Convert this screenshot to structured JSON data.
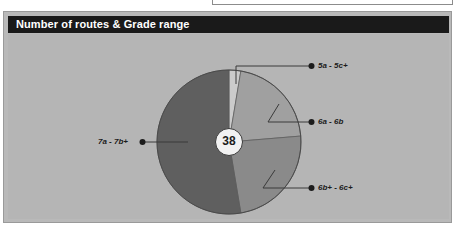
{
  "card": {
    "title": "Number of routes & Grade range",
    "center_total": "38"
  },
  "colors": {
    "title_bar_bg": "#1a1a1a",
    "title_text": "#ffffff",
    "panel_bg": "#b5b5b5",
    "card_border": "#9a9a9a",
    "slice_5a_5c": "#cbcbcb",
    "slice_6a_6b": "#a0a0a0",
    "slice_6bp_6cp": "#8a8a8a",
    "slice_7a_7bp": "#5f5f5f",
    "leader_line": "#3a3a3a",
    "bullet": "#1c1c1c",
    "center_circle_fill": "#f2f2f2"
  },
  "labels": {
    "grade_5a_5c": "5a - 5c+",
    "grade_6a_6b": "6a - 6b",
    "grade_6bp_6cp": "6b+ - 6c+",
    "grade_7a_7bp": "7a - 7b+"
  },
  "chart_data": {
    "type": "pie",
    "title": "Number of routes & Grade range",
    "center_label": "38",
    "total": 38,
    "legend_position": "callout-labels",
    "grid": false,
    "categories": [
      "5a - 5c+",
      "6a - 6b",
      "6b+ - 6c+",
      "7a - 7b+"
    ],
    "values": [
      1,
      8,
      9,
      20
    ],
    "angles_deg": [
      9.5,
      75.8,
      85.3,
      189.4
    ],
    "colors": [
      "#cbcbcb",
      "#a0a0a0",
      "#8a8a8a",
      "#5f5f5f"
    ],
    "series": [
      {
        "name": "Number of routes",
        "values": [
          1,
          8,
          9,
          20
        ]
      }
    ]
  }
}
